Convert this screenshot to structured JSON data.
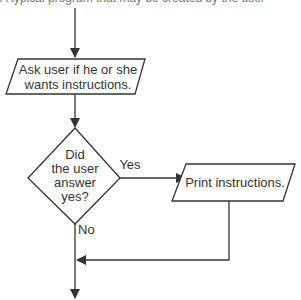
{
  "header": {
    "cut_text": "A typical program that may be created by the user"
  },
  "flowchart": {
    "input_box": {
      "line1": "Ask user if he or she",
      "line2": "wants instructions."
    },
    "decision": {
      "line1": "Did",
      "line2": "the user",
      "line3": "answer",
      "line4": "yes?"
    },
    "yes_label": "Yes",
    "no_label": "No",
    "output_box": {
      "label": "Print instructions."
    }
  },
  "colors": {
    "stroke": "#333333",
    "text": "#333333",
    "background": "#ffffff"
  }
}
